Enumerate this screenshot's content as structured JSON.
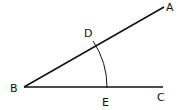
{
  "diagram": {
    "type": "geometry-angle-construction",
    "stroke_color": "#111111",
    "points": {
      "A": {
        "label": "A",
        "x": 164,
        "y": 7
      },
      "B": {
        "label": "B",
        "x": 24,
        "y": 87
      },
      "C": {
        "label": "C",
        "x": 163,
        "y": 87
      },
      "D": {
        "label": "D",
        "x": 96,
        "y": 46
      },
      "E": {
        "label": "E",
        "x": 107,
        "y": 87
      }
    },
    "segments": [
      {
        "from": "B",
        "to": "A"
      },
      {
        "from": "B",
        "to": "C"
      }
    ],
    "arc": {
      "center": "B",
      "through": [
        "D",
        "E"
      ]
    }
  }
}
